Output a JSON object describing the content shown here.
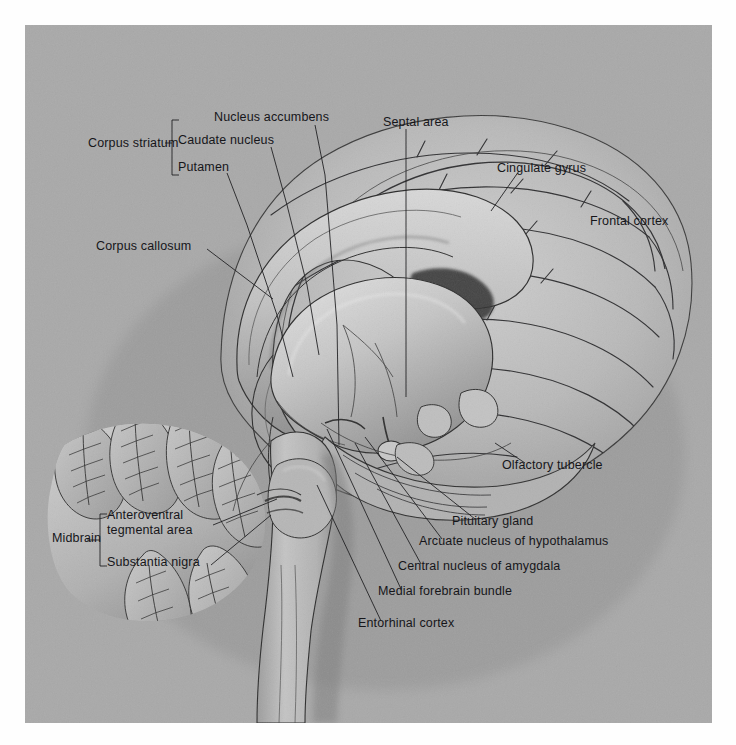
{
  "figure": {
    "kind": "anatomical-illustration",
    "style": "grayscale airbrush / pencil rendering on toned gray ground",
    "background_color": "#a9a9a9",
    "ink_color": "#16161a",
    "page_color": "#ffffff"
  },
  "labels": [
    {
      "id": "corpus-striatum",
      "text": "Corpus striatum",
      "x": 88,
      "y": 118,
      "lines": [
        "Corpus striatum"
      ]
    },
    {
      "id": "nucleus-accumbens",
      "text": "Nucleus accumbens",
      "x": 214,
      "y": 92,
      "lines": [
        "Nucleus accumbens"
      ]
    },
    {
      "id": "caudate-nucleus",
      "text": "Caudate nucleus",
      "x": 178,
      "y": 115,
      "lines": [
        "Caudate nucleus"
      ]
    },
    {
      "id": "putamen",
      "text": "Putamen",
      "x": 178,
      "y": 142,
      "lines": [
        "Putamen"
      ]
    },
    {
      "id": "septal-area",
      "text": "Septal area",
      "x": 383,
      "y": 97,
      "lines": [
        "Septal area"
      ]
    },
    {
      "id": "cingulate-gyrus",
      "text": "Cingulate gyrus",
      "x": 497,
      "y": 143,
      "lines": [
        "Cingulate gyrus"
      ]
    },
    {
      "id": "frontal-cortex",
      "text": "Frontal cortex",
      "x": 590,
      "y": 196,
      "lines": [
        "Frontal cortex"
      ]
    },
    {
      "id": "corpus-callosum",
      "text": "Corpus callosum",
      "x": 96,
      "y": 221,
      "lines": [
        "Corpus callosum"
      ]
    },
    {
      "id": "olfactory-tubercle",
      "text": "Olfactory tubercle",
      "x": 502,
      "y": 440,
      "lines": [
        "Olfactory tubercle"
      ]
    },
    {
      "id": "pituitary-gland",
      "text": "Pituitary gland",
      "x": 452,
      "y": 496,
      "lines": [
        "Pituitary gland"
      ]
    },
    {
      "id": "arcuate-nucleus",
      "text": "Arcuate nucleus of hypothalamus",
      "x": 419,
      "y": 516,
      "lines": [
        "Arcuate nucleus of hypothalamus"
      ]
    },
    {
      "id": "central-nucleus-amygdala",
      "text": "Central nucleus of amygdala",
      "x": 398,
      "y": 541,
      "lines": [
        "Central nucleus of amygdala"
      ]
    },
    {
      "id": "medial-forebrain-bundle",
      "text": "Medial forebrain bundle",
      "x": 378,
      "y": 566,
      "lines": [
        "Medial forebrain bundle"
      ]
    },
    {
      "id": "entorhinal-cortex",
      "text": "Entorhinal cortex",
      "x": 358,
      "y": 598,
      "lines": [
        "Entorhinal cortex"
      ]
    },
    {
      "id": "midbrain",
      "text": "Midbrain",
      "x": 52,
      "y": 513,
      "lines": [
        "Midbrain"
      ]
    },
    {
      "id": "anteroventral-tegmental-area",
      "text": "Anteroventral tegmental area",
      "x": 107,
      "y": 497,
      "lines": [
        "Anteroventral",
        "tegmental area"
      ]
    },
    {
      "id": "substantia-nigra",
      "text": "Substantia nigra",
      "x": 107,
      "y": 537,
      "lines": [
        "Substantia nigra"
      ]
    }
  ],
  "brackets": [
    {
      "id": "corpus-striatum-bracket",
      "x": 172,
      "y_top": 95,
      "y_bottom": 150,
      "tick_x": 165,
      "tick_y": 118,
      "side": "left"
    },
    {
      "id": "midbrain-bracket",
      "x": 100,
      "y_top": 489,
      "y_bottom": 541,
      "tick_x": 93,
      "tick_y": 515,
      "side": "left"
    }
  ],
  "structures": [
    "cerebral cortex with gyri and sulci",
    "cingulate gyrus",
    "corpus callosum",
    "lateral ventricle",
    "caudate nucleus",
    "putamen",
    "nucleus accumbens",
    "septal area",
    "thalamus",
    "hypothalamus with arcuate nucleus",
    "pituitary gland",
    "olfactory tubercle",
    "amygdala",
    "entorhinal cortex",
    "medial forebrain bundle",
    "midbrain: anteroventral tegmental area and substantia nigra",
    "cerebellum with folia",
    "pons",
    "medulla oblongata",
    "spinal cord"
  ]
}
